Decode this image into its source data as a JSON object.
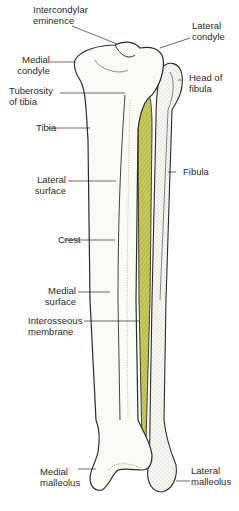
{
  "diagram": {
    "colors": {
      "background": "#ffffff",
      "bone_fill": "#fbfbf6",
      "bone_outline": "#2b2b2b",
      "stipple": "#9a9a9a",
      "membrane_fill": "#c9cc5a",
      "membrane_hatch": "#8f9430",
      "label_text": "#2a2a2a"
    },
    "labels": {
      "intercondylar_eminence": "Intercondylar\neminence",
      "lateral_condyle": "Lateral\ncondyle",
      "medial_condyle": "Medial\ncondyle",
      "head_of_fibula": "Head of\nfibula",
      "tuberosity_of_tibia": "Tuberosity\nof tibia",
      "tibia": "Tibia",
      "fibula": "Fibula",
      "lateral_surface": "Lateral\nsurface",
      "crest": "Crest",
      "medial_surface": "Medial\nsurface",
      "interosseous_membrane": "Interosseous\nmembrane",
      "medial_malleolus": "Medial\nmalleolus",
      "lateral_malleolus": "Lateral\nmalleolus"
    }
  }
}
